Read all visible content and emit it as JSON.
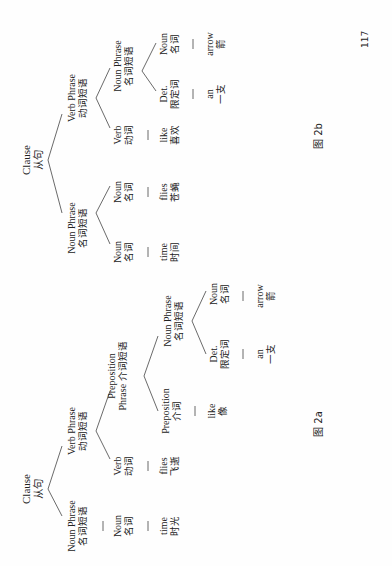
{
  "page_number": "117",
  "figure_2b": {
    "caption": "图 2b",
    "clause": {
      "en": "Clause",
      "zh": "从句"
    },
    "np": {
      "en": "Noun Phrase",
      "zh": "名词短语"
    },
    "np_noun1": {
      "en": "Noun",
      "zh": "名词"
    },
    "np_noun1_word": {
      "en": "time",
      "zh": "时间"
    },
    "np_noun2": {
      "en": "Noun",
      "zh": "名词"
    },
    "np_noun2_word": {
      "en": "flies",
      "zh": "苍蝇"
    },
    "vp": {
      "en": "Verb Phrase",
      "zh": "动词短语"
    },
    "verb": {
      "en": "Verb",
      "zh": "动词"
    },
    "verb_word": {
      "en": "like",
      "zh": "喜欢"
    },
    "np2": {
      "en": "Noun Phrase",
      "zh": "名词短语"
    },
    "det": {
      "en": "Det.",
      "zh": "限定词"
    },
    "det_word": {
      "en": "an",
      "zh": "一支"
    },
    "noun": {
      "en": "Noun",
      "zh": "名词"
    },
    "noun_word": {
      "en": "arrow",
      "zh": "箭"
    }
  },
  "figure_2a": {
    "caption": "图 2a",
    "clause": {
      "en": "Clause",
      "zh": "从句"
    },
    "np": {
      "en": "Noun Phrase",
      "zh": "名词短语"
    },
    "np_noun": {
      "en": "Noun",
      "zh": "名词"
    },
    "np_noun_word": {
      "en": "time",
      "zh": "时光"
    },
    "vp": {
      "en": "Verb Phrase",
      "zh": "动词短语"
    },
    "verb": {
      "en": "Verb",
      "zh": "动词"
    },
    "verb_word": {
      "en": "flies",
      "zh": "飞逝"
    },
    "pp": {
      "en_line1": "Preposition",
      "en_line2": "Phrase",
      "zh": "介词短语"
    },
    "prep": {
      "en": "Preposition",
      "zh": "介词"
    },
    "prep_word": {
      "en": "like",
      "zh": "像"
    },
    "np2": {
      "en": "Noun Phrase",
      "zh": "名词短语"
    },
    "det": {
      "en": "Det.",
      "zh": "限定词"
    },
    "det_word": {
      "en": "an",
      "zh": "一支"
    },
    "noun": {
      "en": "Noun",
      "zh": "名词"
    },
    "noun_word": {
      "en": "arrow",
      "zh": "箭"
    }
  }
}
